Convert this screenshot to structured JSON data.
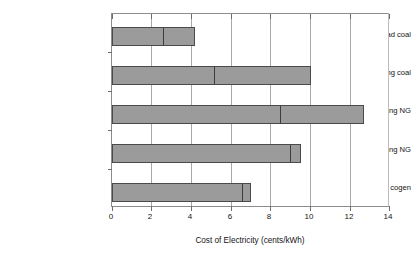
{
  "chart_data": {
    "type": "bar",
    "orientation": "horizontal",
    "title": "",
    "xlabel": "Cost of Electricity (cents/kWh)",
    "ylabel": "",
    "xlim": [
      0,
      14
    ],
    "xticks": [
      0,
      2,
      4,
      6,
      8,
      10,
      12,
      14
    ],
    "xtick_labels": [
      "0",
      "2",
      "4",
      "6",
      "8",
      "10",
      "12",
      "14"
    ],
    "grid": true,
    "grid_axis": "x",
    "legend": false,
    "bar_color": "#9b9b9b",
    "bar_edge_color": "#4a4a4a",
    "categories": [
      "Central baseload coal",
      "Central peaking coal",
      "Central peaking NG",
      "Onsite peaking NG",
      "Peaking NG cogen"
    ],
    "values": [
      4.2,
      10.0,
      12.7,
      9.5,
      7.0
    ],
    "segment_marks": [
      2.5,
      5.1,
      8.4,
      8.9,
      6.5
    ],
    "bars": [
      {
        "category": "Central baseload coal",
        "value": 4.2,
        "segment_mark": 2.5
      },
      {
        "category": "Central peaking coal",
        "value": 10.0,
        "segment_mark": 5.1
      },
      {
        "category": "Central peaking NG",
        "value": 12.7,
        "segment_mark": 8.4
      },
      {
        "category": "Onsite peaking NG",
        "value": 9.5,
        "segment_mark": 8.9
      },
      {
        "category": "Peaking NG cogen",
        "value": 7.0,
        "segment_mark": 6.5
      }
    ]
  },
  "axis": {
    "x_title": "Cost of Electricity (cents/kWh)"
  },
  "labels": {
    "cat0": "Central baseload coal",
    "cat1": "Central peaking coal",
    "cat2": "Central peaking NG",
    "cat3": "Onsite peaking NG",
    "cat4": "Peaking NG cogen"
  },
  "xticks": {
    "t0": "0",
    "t1": "2",
    "t2": "4",
    "t3": "6",
    "t4": "8",
    "t5": "10",
    "t6": "12",
    "t7": "14"
  }
}
